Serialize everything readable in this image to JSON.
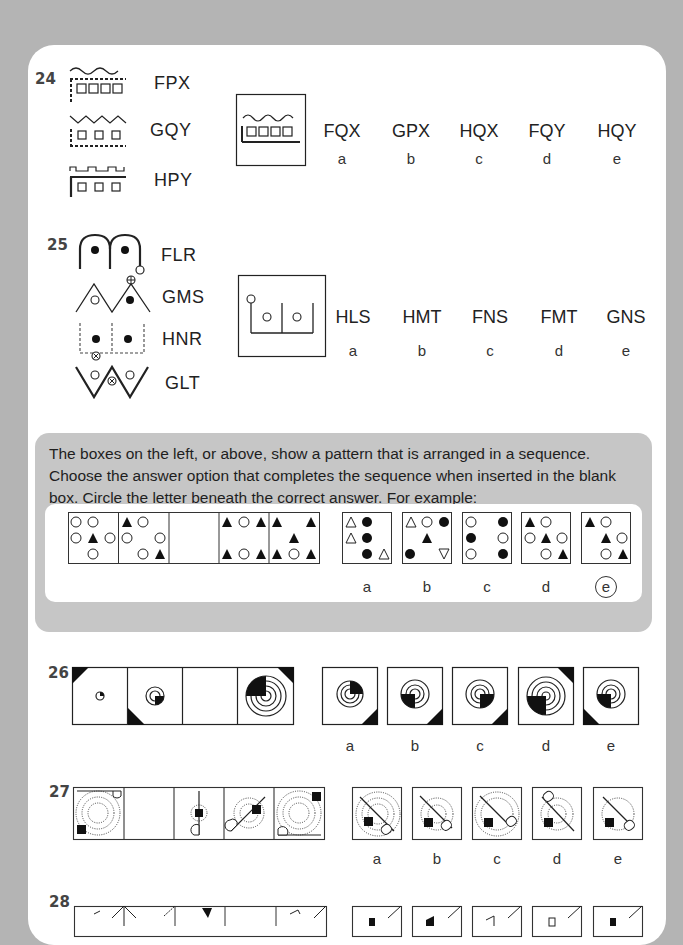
{
  "questions": {
    "q24": {
      "number": "24",
      "examples": [
        {
          "figure": "wave-dashed-box-four-squares",
          "code": "FPX"
        },
        {
          "figure": "zigzag-dashed-box-three-squares",
          "code": "GQY"
        },
        {
          "figure": "square-wave-solid-box-three-squares",
          "code": "HPY"
        }
      ],
      "target_figure": "wave-L-line-four-squares",
      "options": [
        {
          "code": "FQX",
          "letter": "a"
        },
        {
          "code": "GPX",
          "letter": "b"
        },
        {
          "code": "HQX",
          "letter": "c"
        },
        {
          "code": "FQY",
          "letter": "d"
        },
        {
          "code": "HQY",
          "letter": "e"
        }
      ]
    },
    "q25": {
      "number": "25",
      "examples": [
        {
          "figure": "double-arch-filled-dots",
          "code": "FLR"
        },
        {
          "figure": "double-peak-open-filled",
          "code": "GMS"
        },
        {
          "figure": "dashed-boxes-filled-dots",
          "code": "HNR"
        },
        {
          "figure": "double-v-open-dots",
          "code": "GLT"
        }
      ],
      "target_figure": "bracket-open-dots",
      "options": [
        {
          "code": "HLS",
          "letter": "a"
        },
        {
          "code": "HMT",
          "letter": "b"
        },
        {
          "code": "FNS",
          "letter": "c"
        },
        {
          "code": "FMT",
          "letter": "d"
        },
        {
          "code": "GNS",
          "letter": "e"
        }
      ]
    },
    "instructions": {
      "text": "The boxes on the left, or above, show a pattern that is arranged in a sequence. Choose the answer option that completes the sequence when inserted in the blank box. Circle the letter beneath the correct answer. For example:",
      "example_options": [
        "a",
        "b",
        "c",
        "d",
        "e"
      ],
      "example_answer": "e"
    },
    "q26": {
      "number": "26",
      "options": [
        "a",
        "b",
        "c",
        "d",
        "e"
      ]
    },
    "q27": {
      "number": "27",
      "options": [
        "a",
        "b",
        "c",
        "d",
        "e"
      ]
    },
    "q28": {
      "number": "28"
    }
  }
}
